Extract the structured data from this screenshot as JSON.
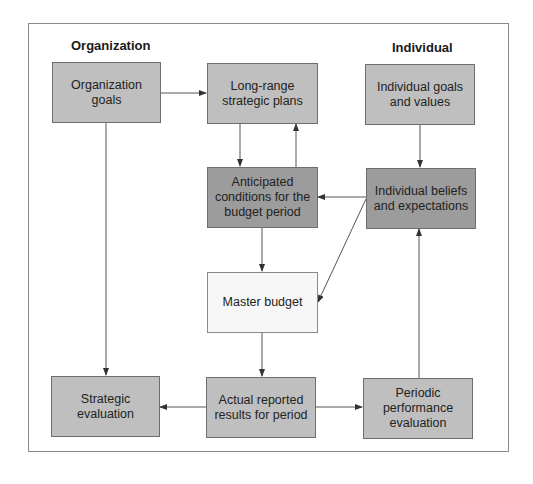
{
  "diagram": {
    "type": "flowchart",
    "headers": {
      "left": "Organization",
      "right": "Individual"
    },
    "colors": {
      "light_box": "#bfbfbf",
      "dark_box": "#9c9c9c",
      "white_box": "#f7f7f7",
      "line": "#555555",
      "frame": "#8a8a8a"
    },
    "nodes": {
      "organization_goals": {
        "label": "Organization\ngoals",
        "shade": "light"
      },
      "long_range_plans": {
        "label": "Long-range\nstrategic plans",
        "shade": "light"
      },
      "individual_goals": {
        "label": "Individual goals\nand values",
        "shade": "light"
      },
      "anticipated_conditions": {
        "label": "Anticipated\nconditions for the\nbudget period",
        "shade": "dark"
      },
      "individual_beliefs": {
        "label": "Individual beliefs\nand expectations",
        "shade": "dark"
      },
      "master_budget": {
        "label": "Master budget",
        "shade": "white"
      },
      "strategic_evaluation": {
        "label": "Strategic\nevaluation",
        "shade": "light"
      },
      "actual_results": {
        "label": "Actual reported\nresults for period",
        "shade": "light"
      },
      "periodic_evaluation": {
        "label": "Periodic\nperformance\nevaluation",
        "shade": "light"
      }
    },
    "edges": [
      {
        "from": "Organization goals",
        "to": "Long-range strategic plans"
      },
      {
        "from": "Organization goals",
        "to": "Strategic evaluation"
      },
      {
        "from": "Long-range strategic plans",
        "to": "Anticipated conditions for the budget period"
      },
      {
        "from": "Anticipated conditions for the budget period",
        "to": "Long-range strategic plans"
      },
      {
        "from": "Individual goals and values",
        "to": "Individual beliefs and expectations"
      },
      {
        "from": "Individual beliefs and expectations",
        "to": "Anticipated conditions for the budget period"
      },
      {
        "from": "Individual beliefs and expectations",
        "to": "Master budget"
      },
      {
        "from": "Anticipated conditions for the budget period",
        "to": "Master budget"
      },
      {
        "from": "Master budget",
        "to": "Actual reported results for period"
      },
      {
        "from": "Actual reported results for period",
        "to": "Strategic evaluation"
      },
      {
        "from": "Actual reported results for period",
        "to": "Periodic performance evaluation"
      },
      {
        "from": "Periodic performance evaluation",
        "to": "Individual beliefs and expectations"
      }
    ]
  }
}
